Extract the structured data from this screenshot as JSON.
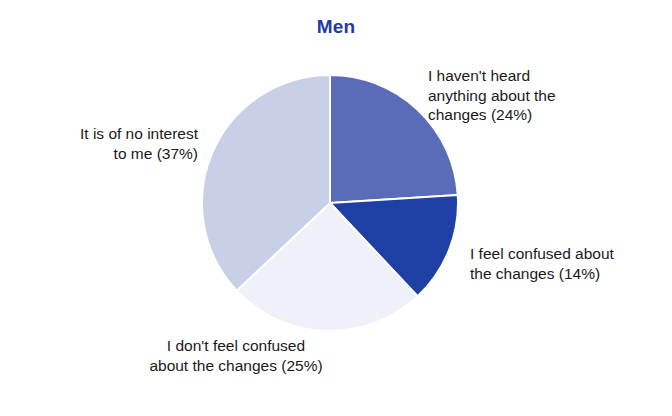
{
  "chart_data": {
    "type": "pie",
    "title": "Men",
    "xlabel": "",
    "ylabel": "",
    "legend_position": "none",
    "grid": false,
    "start_angle_deg": 0,
    "direction": "clockwise",
    "categories": [
      "I haven't heard anything about the changes",
      "I feel confused about the changes",
      "I don't feel confused about the changes",
      "It is of no interest to me"
    ],
    "values": [
      24,
      14,
      25,
      37
    ],
    "value_unit": "%",
    "colors": [
      "#5a6cb8",
      "#1e3fa4",
      "#eef1fa",
      "#c8d0e8"
    ],
    "slices": [
      {
        "name": "I haven't heard anything about the changes",
        "value": 24,
        "label": "I haven't heard\nanything about the\nchanges (24%)",
        "color": "#5a6cb8"
      },
      {
        "name": "I feel confused about the changes",
        "value": 14,
        "label": "I feel confused about\nthe changes (14%)",
        "color": "#1e3fa4"
      },
      {
        "name": "I don't feel confused about the changes",
        "value": 25,
        "label": "I don't feel confused\nabout the changes (25%)",
        "color": "#eef1fa"
      },
      {
        "name": "It is of no interest to me",
        "value": 37,
        "label": "It is of no interest\nto me (37%)",
        "color": "#c8d0e8"
      }
    ]
  },
  "style": {
    "title_color": "#2239a8",
    "label_color": "#1a1a1a",
    "background": "#ffffff",
    "separator_color": "#ffffff"
  }
}
